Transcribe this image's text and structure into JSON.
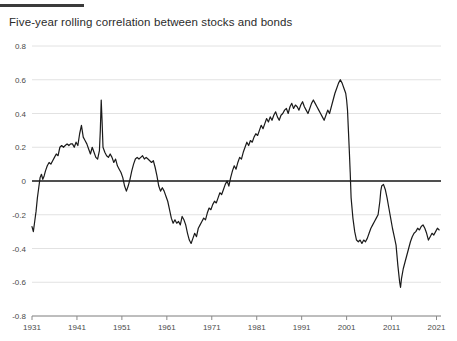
{
  "header": {
    "title": "Five-year rolling correlation between stocks and bonds",
    "rule_color": "#3b3b3b"
  },
  "chart_data": {
    "type": "line",
    "title": "Five-year rolling correlation between stocks and bonds",
    "xlabel": "",
    "ylabel": "",
    "xlim": [
      1931,
      2022
    ],
    "ylim": [
      -0.8,
      0.8
    ],
    "grid": true,
    "legend": "none",
    "zero_line": 0,
    "line_color": "#1a1a1a",
    "grid_color": "#e2e2e2",
    "axis_color": "#8a8a8a",
    "ytick_labels": [
      "0.8",
      "0.6",
      "0.4",
      "0.2",
      "0",
      "-0.2",
      "-0.4",
      "-0.6",
      "-0.8"
    ],
    "ytick_values": [
      0.8,
      0.6,
      0.4,
      0.2,
      0,
      -0.2,
      -0.4,
      -0.6,
      -0.8
    ],
    "xtick_labels": [
      "1931",
      "1941",
      "1951",
      "1961",
      "1971",
      "1981",
      "1991",
      "2001",
      "2011",
      "2021"
    ],
    "xtick_values": [
      1931,
      1941,
      1951,
      1961,
      1971,
      1981,
      1991,
      2001,
      2011,
      2021
    ],
    "series": [
      {
        "name": "Five-year rolling correlation",
        "x": [
          1931.0,
          1931.3,
          1931.6,
          1931.9,
          1932.2,
          1932.5,
          1932.8,
          1933.1,
          1933.4,
          1933.7,
          1934.0,
          1934.4,
          1934.8,
          1935.2,
          1935.6,
          1936.0,
          1936.4,
          1936.8,
          1937.2,
          1937.6,
          1938.0,
          1938.4,
          1938.8,
          1939.2,
          1939.6,
          1940.0,
          1940.4,
          1940.8,
          1941.2,
          1941.6,
          1942.0,
          1942.4,
          1942.8,
          1943.2,
          1943.6,
          1944.0,
          1944.4,
          1944.8,
          1945.2,
          1945.6,
          1946.0,
          1946.2,
          1946.4,
          1946.6,
          1946.8,
          1947.2,
          1947.6,
          1948.0,
          1948.4,
          1948.8,
          1949.2,
          1949.6,
          1950.0,
          1950.4,
          1950.8,
          1951.2,
          1951.6,
          1952.0,
          1952.4,
          1952.8,
          1953.2,
          1953.6,
          1954.0,
          1954.4,
          1954.8,
          1955.2,
          1955.6,
          1956.0,
          1956.4,
          1956.8,
          1957.2,
          1957.6,
          1958.0,
          1958.4,
          1958.8,
          1959.2,
          1959.6,
          1960.0,
          1960.4,
          1960.8,
          1961.2,
          1961.6,
          1962.0,
          1962.4,
          1962.8,
          1963.2,
          1963.6,
          1964.0,
          1964.4,
          1964.8,
          1965.2,
          1965.6,
          1966.0,
          1966.4,
          1966.8,
          1967.2,
          1967.6,
          1968.0,
          1968.4,
          1968.8,
          1969.2,
          1969.6,
          1970.0,
          1970.4,
          1970.8,
          1971.2,
          1971.6,
          1972.0,
          1972.4,
          1972.8,
          1973.2,
          1973.6,
          1974.0,
          1974.4,
          1974.8,
          1975.2,
          1975.6,
          1976.0,
          1976.4,
          1976.8,
          1977.2,
          1977.6,
          1978.0,
          1978.4,
          1978.8,
          1979.2,
          1979.6,
          1980.0,
          1980.4,
          1980.8,
          1981.2,
          1981.6,
          1982.0,
          1982.4,
          1982.8,
          1983.2,
          1983.6,
          1984.0,
          1984.4,
          1984.8,
          1985.2,
          1985.6,
          1986.0,
          1986.4,
          1986.8,
          1987.2,
          1987.6,
          1988.0,
          1988.4,
          1988.8,
          1989.2,
          1989.6,
          1990.0,
          1990.4,
          1990.8,
          1991.2,
          1991.6,
          1992.0,
          1992.4,
          1992.8,
          1993.2,
          1993.6,
          1994.0,
          1994.4,
          1994.8,
          1995.2,
          1995.6,
          1996.0,
          1996.4,
          1996.8,
          1997.2,
          1997.6,
          1998.0,
          1998.4,
          1998.8,
          1999.2,
          1999.6,
          2000.0,
          2000.4,
          2000.8,
          2001.0,
          2001.2,
          2001.4,
          2001.6,
          2001.8,
          2002.0,
          2002.4,
          2002.8,
          2003.2,
          2003.6,
          2004.0,
          2004.4,
          2004.8,
          2005.2,
          2005.6,
          2006.0,
          2006.4,
          2006.8,
          2007.2,
          2007.6,
          2008.0,
          2008.2,
          2008.4,
          2008.6,
          2008.8,
          2009.2,
          2009.6,
          2010.0,
          2010.4,
          2010.8,
          2011.2,
          2011.6,
          2012.0,
          2012.4,
          2012.8,
          2013.0,
          2013.2,
          2013.6,
          2014.0,
          2014.4,
          2014.8,
          2015.2,
          2015.6,
          2016.0,
          2016.4,
          2016.8,
          2017.2,
          2017.6,
          2018.0,
          2018.4,
          2018.8,
          2019.2,
          2019.6,
          2020.0,
          2020.4,
          2020.8,
          2021.2,
          2021.6
        ],
        "y": [
          -0.27,
          -0.3,
          -0.24,
          -0.18,
          -0.1,
          -0.04,
          0.02,
          0.04,
          0.01,
          0.03,
          0.06,
          0.09,
          0.11,
          0.1,
          0.12,
          0.14,
          0.16,
          0.15,
          0.2,
          0.21,
          0.2,
          0.21,
          0.22,
          0.21,
          0.22,
          0.22,
          0.2,
          0.23,
          0.21,
          0.28,
          0.33,
          0.26,
          0.24,
          0.22,
          0.19,
          0.16,
          0.2,
          0.17,
          0.14,
          0.13,
          0.18,
          0.3,
          0.48,
          0.35,
          0.2,
          0.17,
          0.15,
          0.14,
          0.16,
          0.14,
          0.11,
          0.13,
          0.09,
          0.07,
          0.05,
          0.02,
          -0.03,
          -0.06,
          -0.03,
          0.01,
          0.06,
          0.1,
          0.13,
          0.14,
          0.13,
          0.14,
          0.15,
          0.13,
          0.14,
          0.13,
          0.12,
          0.11,
          0.12,
          0.08,
          0.03,
          -0.03,
          -0.06,
          -0.04,
          -0.06,
          -0.09,
          -0.12,
          -0.17,
          -0.22,
          -0.25,
          -0.23,
          -0.25,
          -0.24,
          -0.26,
          -0.21,
          -0.23,
          -0.26,
          -0.31,
          -0.35,
          -0.37,
          -0.34,
          -0.31,
          -0.33,
          -0.28,
          -0.26,
          -0.24,
          -0.22,
          -0.23,
          -0.19,
          -0.16,
          -0.17,
          -0.14,
          -0.12,
          -0.13,
          -0.1,
          -0.07,
          -0.08,
          -0.05,
          -0.02,
          0.0,
          -0.03,
          0.02,
          0.06,
          0.09,
          0.07,
          0.11,
          0.14,
          0.13,
          0.17,
          0.2,
          0.23,
          0.21,
          0.24,
          0.23,
          0.26,
          0.28,
          0.27,
          0.3,
          0.33,
          0.31,
          0.34,
          0.37,
          0.35,
          0.38,
          0.36,
          0.39,
          0.41,
          0.38,
          0.36,
          0.39,
          0.4,
          0.42,
          0.43,
          0.4,
          0.44,
          0.46,
          0.43,
          0.45,
          0.44,
          0.42,
          0.45,
          0.47,
          0.44,
          0.42,
          0.4,
          0.43,
          0.46,
          0.48,
          0.46,
          0.44,
          0.42,
          0.4,
          0.38,
          0.36,
          0.39,
          0.42,
          0.4,
          0.44,
          0.48,
          0.52,
          0.55,
          0.58,
          0.6,
          0.58,
          0.55,
          0.52,
          0.48,
          0.42,
          0.3,
          0.18,
          0.05,
          -0.1,
          -0.22,
          -0.3,
          -0.35,
          -0.36,
          -0.35,
          -0.37,
          -0.35,
          -0.36,
          -0.34,
          -0.31,
          -0.28,
          -0.26,
          -0.24,
          -0.22,
          -0.2,
          -0.16,
          -0.12,
          -0.06,
          -0.03,
          -0.02,
          -0.05,
          -0.1,
          -0.16,
          -0.22,
          -0.28,
          -0.33,
          -0.38,
          -0.5,
          -0.6,
          -0.63,
          -0.58,
          -0.52,
          -0.48,
          -0.44,
          -0.4,
          -0.36,
          -0.33,
          -0.31,
          -0.3,
          -0.28,
          -0.29,
          -0.27,
          -0.26,
          -0.28,
          -0.31,
          -0.35,
          -0.33,
          -0.31,
          -0.32,
          -0.3,
          -0.28,
          -0.29
        ]
      }
    ]
  }
}
